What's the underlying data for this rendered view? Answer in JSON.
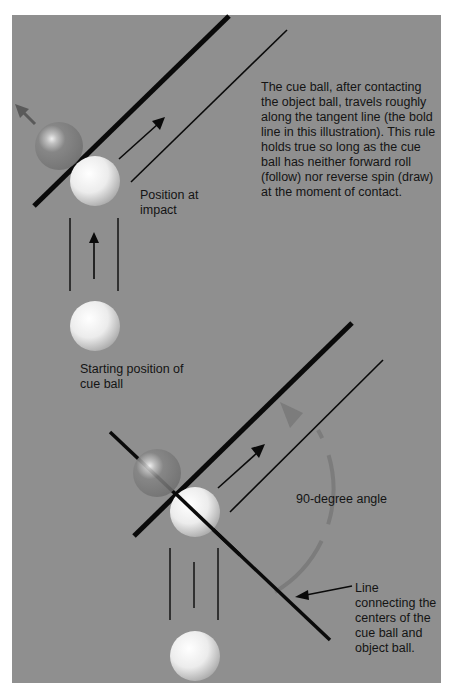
{
  "diagram": {
    "colors": {
      "background": "#8f8f8f",
      "page": "#ffffff",
      "line": "#0a0a0a",
      "cue_ball": "#f2f2f2",
      "object_ball_ghost": "#7a7a7a",
      "arc": "#6e6e6e"
    },
    "labels": {
      "caption": "The cue ball, after contacting the object ball, travels roughly along the tangent line (the bold line in this illustration). This rule holds true so long as the cue ball has neither forward roll (follow) nor reverse spin (draw) at the moment of contact.",
      "position_at_impact": "Position at impact",
      "starting_position": "Starting position of cue ball",
      "angle": "90-degree angle",
      "connecting_line": "Line connecting the centers of the cue ball and object ball."
    },
    "figures": [
      {
        "name": "top-figure",
        "elements": [
          "tangent-line-bold",
          "parallel-thin-line",
          "travel-arrow",
          "object-ball-ghost",
          "object-ball-arrow",
          "cue-ball-impact",
          "approach-lines",
          "cue-ball-start"
        ]
      },
      {
        "name": "bottom-figure",
        "elements": [
          "tangent-line-bold",
          "center-line",
          "parallel-thin-line",
          "travel-arrow",
          "object-ball-ghost",
          "cue-ball-impact",
          "right-angle-arc",
          "approach-lines",
          "cue-ball-start",
          "pointer-arrow"
        ]
      }
    ]
  }
}
